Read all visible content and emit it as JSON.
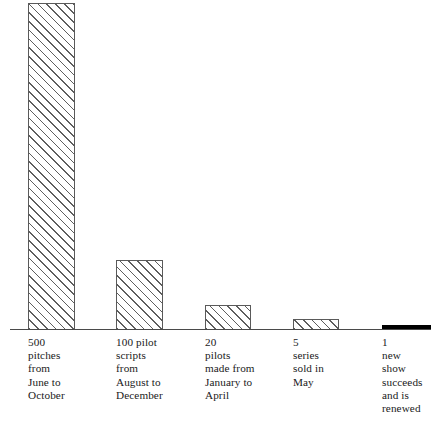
{
  "chart_data": {
    "type": "bar",
    "title": "",
    "subtitle": "",
    "xlabel": "",
    "ylabel": "",
    "grid": false,
    "legend": "none",
    "orientation": "vertical",
    "ylim": [
      0,
      500
    ],
    "categories": [
      "500 pitches from June to October",
      "100 pilot scripts from August to December",
      "20 pilots made from January to April",
      "5 series sold in May",
      "1 new show succeeds and is renewed"
    ],
    "values": [
      500,
      100,
      20,
      5,
      1
    ],
    "tick_labels": [
      "500\npitches\nfrom\nJune to\nOctober",
      "100 pilot\nscripts\nfrom\nAugust to\nDecember",
      "20\npilots\nmade from\nJanuary to\nApril",
      "5\nseries\nsold in\nMay",
      "1\nnew\nshow\nsucceeds\nand is\nrenewed"
    ],
    "annotations": []
  },
  "colors": {
    "background": "#ffffff",
    "bar_outline": "#5a5a5a",
    "bar_hatch": "#5e5e5e",
    "bar_fill": "#ffffff",
    "solid_bar": "#000000",
    "axis": "#4a4a4a",
    "text": "#1a1a1a"
  },
  "bars": [
    {
      "name": "bar-500-pitches",
      "value": 500,
      "value_text": "500",
      "fill_style": "diagonal-hatch",
      "left": 28,
      "top": 3,
      "width": 47,
      "height": 327,
      "label": "500\npitches\nfrom\nJune to\nOctober",
      "label_left": 28
    },
    {
      "name": "bar-100-pilot-scripts",
      "value": 100,
      "value_text": "100",
      "fill_style": "diagonal-hatch",
      "left": 116,
      "top": 260,
      "width": 47,
      "height": 70,
      "label": "100 pilot\nscripts\nfrom\nAugust to\nDecember",
      "label_left": 116
    },
    {
      "name": "bar-20-pilots",
      "value": 20,
      "value_text": "20",
      "fill_style": "diagonal-hatch",
      "left": 205,
      "top": 305,
      "width": 46,
      "height": 25,
      "label": "20\npilots\nmade from\nJanuary to\nApril",
      "label_left": 205
    },
    {
      "name": "bar-5-series",
      "value": 5,
      "value_text": "5",
      "fill_style": "diagonal-hatch",
      "left": 293,
      "top": 319,
      "width": 46,
      "height": 11,
      "label": "5\nseries\nsold in\nMay",
      "label_left": 293
    },
    {
      "name": "bar-1-new-show",
      "value": 1,
      "value_text": "1",
      "fill_style": "solid",
      "left": 382,
      "top": 325,
      "width": 49,
      "height": 5,
      "label": "1\nnew\nshow\nsucceeds\nand is\nrenewed",
      "label_left": 382
    }
  ]
}
